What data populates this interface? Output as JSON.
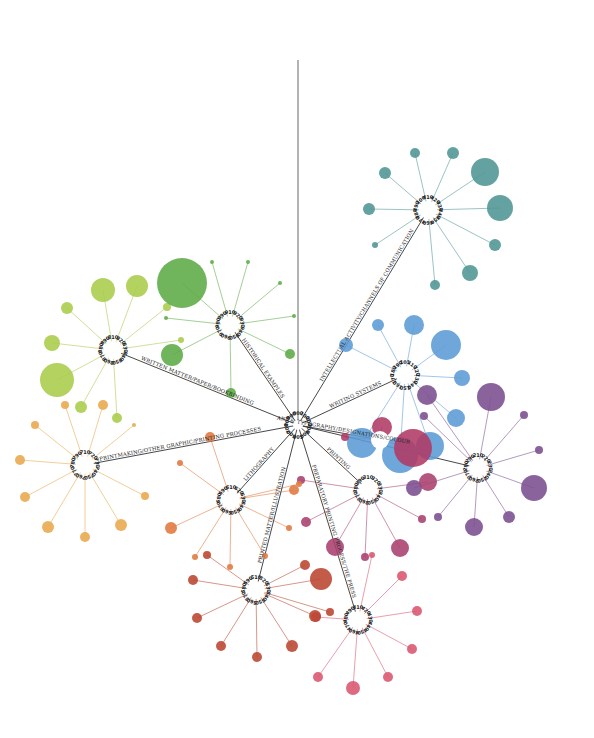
{
  "diagram": {
    "type": "radial-tree",
    "root": {
      "x": 298,
      "y": 425
    },
    "top_line": {
      "x1": 298,
      "y1": 60,
      "x2": 298,
      "y2": 420
    },
    "root_codes": [
      "000",
      "100",
      "200",
      "300",
      "400",
      "500",
      "600",
      "700",
      "800",
      "900"
    ],
    "branches": [
      {
        "id": "intellectual",
        "label": "INTELLECTUAL ACTIVITY/CHANNELS OF COMMUNICATION",
        "color": "#4e9594",
        "hub": {
          "x": 428,
          "y": 210
        },
        "codes": [
          "410",
          "420",
          "430",
          "440",
          "450",
          "460",
          "470",
          "480",
          "490",
          "100"
        ],
        "leaves": [
          {
            "x": 415,
            "y": 153,
            "r": 5
          },
          {
            "x": 453,
            "y": 153,
            "r": 6
          },
          {
            "x": 485,
            "y": 172,
            "r": 14
          },
          {
            "x": 500,
            "y": 208,
            "r": 13
          },
          {
            "x": 495,
            "y": 245,
            "r": 6
          },
          {
            "x": 470,
            "y": 273,
            "r": 8
          },
          {
            "x": 435,
            "y": 285,
            "r": 5
          },
          {
            "x": 375,
            "y": 245,
            "r": 3
          },
          {
            "x": 369,
            "y": 209,
            "r": 6
          },
          {
            "x": 385,
            "y": 173,
            "r": 6
          }
        ]
      },
      {
        "id": "writing-systems",
        "label": "WRITING SYSTEMS",
        "color": "#5b9bd5",
        "hub": {
          "x": 405,
          "y": 375
        },
        "codes": [
          "101",
          "110",
          "120",
          "130",
          "140",
          "150",
          "160",
          "170",
          "180",
          "190"
        ],
        "leaves": [
          {
            "x": 346,
            "y": 345,
            "r": 7
          },
          {
            "x": 378,
            "y": 325,
            "r": 6
          },
          {
            "x": 414,
            "y": 325,
            "r": 10
          },
          {
            "x": 446,
            "y": 345,
            "r": 15
          },
          {
            "x": 462,
            "y": 378,
            "r": 8
          },
          {
            "x": 456,
            "y": 418,
            "r": 9
          },
          {
            "x": 362,
            "y": 443,
            "r": 15
          },
          {
            "x": 400,
            "y": 455,
            "r": 18
          },
          {
            "x": 430,
            "y": 446,
            "r": 14
          }
        ]
      },
      {
        "id": "art-of-typography",
        "label": "ART & TYPOGRAPHY/DESIGNATIONS/COLOUR",
        "color": "#b03a64",
        "hub": {
          "x": 380,
          "y": 440
        },
        "codes": [],
        "leaves": [
          {
            "x": 345,
            "y": 437,
            "r": 4
          },
          {
            "x": 382,
            "y": 427,
            "r": 10
          },
          {
            "x": 413,
            "y": 448,
            "r": 19
          }
        ]
      },
      {
        "id": "purple",
        "label": "",
        "color": "#7b4d8e",
        "hub": {
          "x": 478,
          "y": 468
        },
        "codes": [
          "210",
          "220",
          "230",
          "240",
          "250",
          "260",
          "270",
          "280",
          "290"
        ],
        "leaves": [
          {
            "x": 427,
            "y": 395,
            "r": 10
          },
          {
            "x": 491,
            "y": 397,
            "r": 14
          },
          {
            "x": 524,
            "y": 415,
            "r": 4
          },
          {
            "x": 539,
            "y": 450,
            "r": 4
          },
          {
            "x": 534,
            "y": 488,
            "r": 13
          },
          {
            "x": 509,
            "y": 517,
            "r": 6
          },
          {
            "x": 474,
            "y": 527,
            "r": 9
          },
          {
            "x": 438,
            "y": 517,
            "r": 4
          },
          {
            "x": 414,
            "y": 488,
            "r": 8
          },
          {
            "x": 424,
            "y": 416,
            "r": 4
          }
        ]
      },
      {
        "id": "printing",
        "label": "PRINTING",
        "color": "#a9406e",
        "hub": {
          "x": 368,
          "y": 490
        },
        "codes": [
          "310",
          "320",
          "330",
          "340",
          "350",
          "360",
          "370",
          "380",
          "390"
        ],
        "leaves": [
          {
            "x": 428,
            "y": 482,
            "r": 9
          },
          {
            "x": 422,
            "y": 519,
            "r": 4
          },
          {
            "x": 400,
            "y": 548,
            "r": 9
          },
          {
            "x": 365,
            "y": 557,
            "r": 4
          },
          {
            "x": 335,
            "y": 547,
            "r": 9
          },
          {
            "x": 306,
            "y": 522,
            "r": 5
          },
          {
            "x": 301,
            "y": 480,
            "r": 4
          }
        ]
      },
      {
        "id": "press",
        "label": "PREPARATORY PRINTING PROCESS/THE PRESS",
        "color": "#d9556e",
        "hub": {
          "x": 358,
          "y": 620
        },
        "codes": [
          "410",
          "420",
          "430",
          "440",
          "450",
          "460",
          "470",
          "480",
          "490"
        ],
        "leaves": [
          {
            "x": 402,
            "y": 576,
            "r": 5
          },
          {
            "x": 417,
            "y": 611,
            "r": 5
          },
          {
            "x": 412,
            "y": 649,
            "r": 5
          },
          {
            "x": 388,
            "y": 677,
            "r": 5
          },
          {
            "x": 353,
            "y": 688,
            "r": 7
          },
          {
            "x": 318,
            "y": 677,
            "r": 5
          },
          {
            "x": 316,
            "y": 617,
            "r": 5
          },
          {
            "x": 372,
            "y": 555,
            "r": 3
          }
        ]
      },
      {
        "id": "printed-matter",
        "label": "PRINTED MATTER/ILLUSTRATION",
        "color": "#b9462f",
        "hub": {
          "x": 256,
          "y": 590
        },
        "codes": [
          "510",
          "520",
          "530",
          "540",
          "550",
          "560",
          "570",
          "580",
          "590"
        ],
        "leaves": [
          {
            "x": 305,
            "y": 565,
            "r": 5
          },
          {
            "x": 321,
            "y": 579,
            "r": 11
          },
          {
            "x": 315,
            "y": 616,
            "r": 6
          },
          {
            "x": 292,
            "y": 646,
            "r": 6
          },
          {
            "x": 257,
            "y": 657,
            "r": 5
          },
          {
            "x": 221,
            "y": 646,
            "r": 5
          },
          {
            "x": 197,
            "y": 618,
            "r": 5
          },
          {
            "x": 193,
            "y": 580,
            "r": 5
          },
          {
            "x": 207,
            "y": 555,
            "r": 4
          },
          {
            "x": 330,
            "y": 612,
            "r": 4
          }
        ]
      },
      {
        "id": "lithography",
        "label": "LITHOGRAPHY",
        "color": "#e0783f",
        "hub": {
          "x": 231,
          "y": 500
        },
        "codes": [
          "610",
          "620",
          "630",
          "640",
          "650",
          "660",
          "670",
          "680",
          "690"
        ],
        "leaves": [
          {
            "x": 210,
            "y": 437,
            "r": 5
          },
          {
            "x": 180,
            "y": 463,
            "r": 3
          },
          {
            "x": 171,
            "y": 528,
            "r": 6
          },
          {
            "x": 195,
            "y": 557,
            "r": 3
          },
          {
            "x": 230,
            "y": 567,
            "r": 3
          },
          {
            "x": 265,
            "y": 556,
            "r": 3
          },
          {
            "x": 289,
            "y": 528,
            "r": 3
          },
          {
            "x": 294,
            "y": 490,
            "r": 5
          },
          {
            "x": 299,
            "y": 484,
            "r": 3
          }
        ]
      },
      {
        "id": "printmaking",
        "label": "PRINTMAKING/OTHER GRAPHIC/PRINTING PROCESSES",
        "color": "#e8a94b",
        "hub": {
          "x": 85,
          "y": 465
        },
        "codes": [
          "710",
          "720",
          "730",
          "740",
          "750",
          "760",
          "770",
          "780",
          "790"
        ],
        "leaves": [
          {
            "x": 35,
            "y": 425,
            "r": 4
          },
          {
            "x": 20,
            "y": 460,
            "r": 5
          },
          {
            "x": 25,
            "y": 497,
            "r": 5
          },
          {
            "x": 48,
            "y": 527,
            "r": 6
          },
          {
            "x": 85,
            "y": 537,
            "r": 5
          },
          {
            "x": 121,
            "y": 525,
            "r": 6
          },
          {
            "x": 145,
            "y": 496,
            "r": 4
          },
          {
            "x": 134,
            "y": 425,
            "r": 2
          },
          {
            "x": 65,
            "y": 405,
            "r": 4
          },
          {
            "x": 103,
            "y": 405,
            "r": 5
          }
        ]
      },
      {
        "id": "written-matter",
        "label": "WRITTEN MATTER/PAPER/BOOKBINDING",
        "color": "#a9cc4a",
        "hub": {
          "x": 113,
          "y": 350
        },
        "codes": [
          "810",
          "820",
          "830",
          "840",
          "850",
          "860",
          "870",
          "880",
          "890"
        ],
        "leaves": [
          {
            "x": 103,
            "y": 290,
            "r": 12
          },
          {
            "x": 137,
            "y": 286,
            "r": 11
          },
          {
            "x": 67,
            "y": 308,
            "r": 6
          },
          {
            "x": 52,
            "y": 343,
            "r": 8
          },
          {
            "x": 57,
            "y": 380,
            "r": 17
          },
          {
            "x": 81,
            "y": 407,
            "r": 6
          },
          {
            "x": 117,
            "y": 418,
            "r": 5
          },
          {
            "x": 167,
            "y": 307,
            "r": 4
          },
          {
            "x": 181,
            "y": 340,
            "r": 3
          }
        ]
      },
      {
        "id": "historical",
        "label": "HISTORICAL EXAMPLES",
        "color": "#5cab45",
        "hub": {
          "x": 230,
          "y": 325
        },
        "codes": [
          "910",
          "920",
          "930",
          "940",
          "950",
          "960",
          "970",
          "980",
          "990"
        ],
        "leaves": [
          {
            "x": 182,
            "y": 283,
            "r": 25
          },
          {
            "x": 212,
            "y": 262,
            "r": 2
          },
          {
            "x": 248,
            "y": 262,
            "r": 2
          },
          {
            "x": 280,
            "y": 283,
            "r": 2
          },
          {
            "x": 294,
            "y": 316,
            "r": 2
          },
          {
            "x": 290,
            "y": 354,
            "r": 5
          },
          {
            "x": 231,
            "y": 393,
            "r": 5
          },
          {
            "x": 172,
            "y": 355,
            "r": 11
          },
          {
            "x": 166,
            "y": 318,
            "r": 2
          }
        ]
      }
    ]
  }
}
